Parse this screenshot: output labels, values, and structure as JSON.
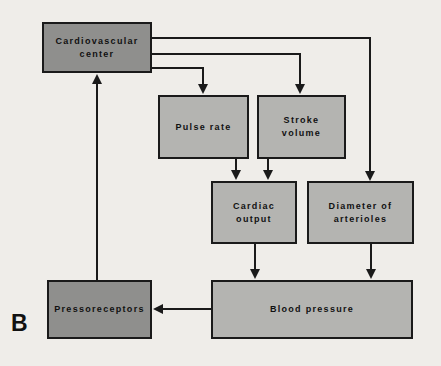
{
  "panel_label": "B",
  "colors": {
    "dark_box": "#8f8f8d",
    "light_box": "#b4b4b1",
    "background": "#efede9",
    "line": "#1a1a1a",
    "text": "#111111"
  },
  "nodes": {
    "cardiovascular_center": {
      "line1": "Cardiovascular",
      "line2": "center"
    },
    "pulse_rate": {
      "label": "Pulse rate"
    },
    "stroke_volume": {
      "line1": "Stroke",
      "line2": "volume"
    },
    "cardiac_output": {
      "line1": "Cardiac",
      "line2": "output"
    },
    "diameter_of_arterioles": {
      "line1": "Diameter of",
      "line2": "arterioles"
    },
    "blood_pressure": {
      "label": "Blood pressure"
    },
    "pressoreceptors": {
      "label": "Pressoreceptors"
    }
  },
  "edges": [
    {
      "from": "cardiovascular_center",
      "to": "pulse_rate"
    },
    {
      "from": "cardiovascular_center",
      "to": "stroke_volume"
    },
    {
      "from": "cardiovascular_center",
      "to": "diameter_of_arterioles"
    },
    {
      "from": "pulse_rate",
      "to": "cardiac_output"
    },
    {
      "from": "stroke_volume",
      "to": "cardiac_output"
    },
    {
      "from": "cardiac_output",
      "to": "blood_pressure"
    },
    {
      "from": "diameter_of_arterioles",
      "to": "blood_pressure"
    },
    {
      "from": "blood_pressure",
      "to": "pressoreceptors"
    },
    {
      "from": "pressoreceptors",
      "to": "cardiovascular_center"
    }
  ]
}
